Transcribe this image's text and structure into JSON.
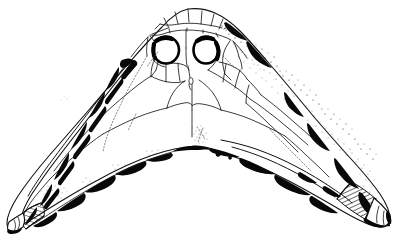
{
  "figure": {
    "view": "dorsal",
    "caption": "",
    "label": "",
    "scale_bar": "",
    "background_color": "#ffffff",
    "ink_color": "#000000",
    "stipple_color": "#2a2a2a",
    "line_color": "#111111"
  },
  "canvas": {
    "width": 403,
    "height": 239
  },
  "anatomy": {
    "orbits": [
      {
        "name": "left-orbit",
        "cx": 166,
        "cy": 50,
        "rx": 13,
        "ry": 13.5
      },
      {
        "name": "right-orbit",
        "cx": 206,
        "cy": 50,
        "rx": 12.5,
        "ry": 13.5
      }
    ],
    "pineal_foramen": {
      "cx": 192,
      "cy": 79,
      "rx": 2.2,
      "ry": 3.6
    },
    "apex": {
      "x": 192,
      "y": 147
    },
    "snout_top": {
      "x": 190,
      "y": 10
    },
    "left_horn_tip": {
      "x": 11,
      "y": 228
    },
    "right_horn_tip": {
      "x": 392,
      "y": 222
    }
  },
  "features": {
    "left_tip_hatching": "cross-section-hatch-left",
    "right_tip_hatching": "cross-section-hatch-right",
    "right_margin_shading": "stipple-shading",
    "sutures_visible": true,
    "tessellated_snout_plates": true
  },
  "shapes": {
    "body_outline": "M 190 10 L 200 10 L 211 12 L 222 17 L 232 24 L 243 33 L 254 44 L 266 57 L 278 70 L 289 83 L 300 96 L 311 109 L 322 122 L 333 134 L 344 146 L 354 157 L 364 168 L 373 179 L 381 190 L 387 200 L 391 210 L 392 218 L 390 224 L 385 227 L 377 227 L 368 224 L 358 219 L 347 212 L 334 204 L 320 195 L 305 186 L 289 176 L 272 168 L 254 160 L 236 154 L 218 150 L 204 147 L 192 147 L 180 148 L 166 151 L 150 156 L 133 162 L 115 170 L 97 179 L 80 188 L 64 197 L 49 206 L 36 214 L 25 221 L 17 226 L 12 228 L 9 226 L 8 221 L 10 213 L 16 203 L 24 192 L 34 180 L 45 168 L 57 155 L 70 142 L 83 128 L 96 114 L 109 100 L 122 86 L 134 72 L 146 58 L 157 45 L 167 33 L 176 23 L 183 15 Z",
    "left_wing_inner": "M 147 56 L 136 68 L 124 82 L 112 96 L 100 110 L 88 124 L 76 138 L 65 152 L 55 165 L 46 177 L 38 189 L 32 199 L 28 208 L 27 215 L 30 219",
    "right_wing_inner": "M 238 57 L 249 69 L 260 82 L 272 95 L 284 108 L 296 121 L 308 134 L 320 147 L 331 159 L 341 171 L 350 182 L 357 192 L 362 201 L 365 209 L 364 215"
  }
}
